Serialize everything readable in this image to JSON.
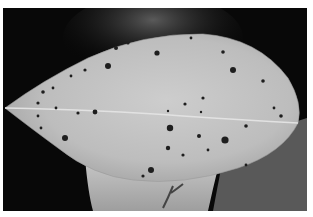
{
  "image": {
    "subject": "Leaf with dark lesion spots held against a dark background",
    "mode": "grayscale",
    "colors": {
      "background_dark": "#080808",
      "leaf_light": "#c4c4c4",
      "leaf_mid": "#a8a8a8",
      "spot_dark": "#1e1e1e",
      "hand": "#b0b0b0",
      "frame": "#ffffff"
    }
  }
}
